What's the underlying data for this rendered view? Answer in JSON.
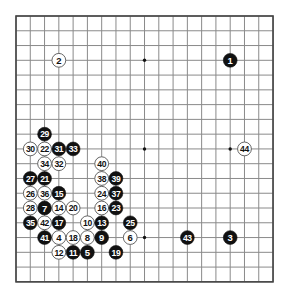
{
  "board": {
    "size": 19,
    "origin": {
      "x": 16,
      "y": 16
    },
    "step": {
      "x": 14.28,
      "y": 14.77
    },
    "colors": {
      "background": "#ffffff",
      "grid_line": "#8a8a8a",
      "border": "#444444",
      "star_point": "#111111",
      "black_stone": "#111111",
      "black_stone_text": "#ffffff",
      "white_stone": "#ffffff",
      "white_stone_border": "#555555",
      "white_stone_text": "#111111"
    },
    "star_points": [
      [
        4,
        4
      ],
      [
        10,
        4
      ],
      [
        16,
        4
      ],
      [
        4,
        10
      ],
      [
        10,
        10
      ],
      [
        16,
        10
      ],
      [
        4,
        16
      ],
      [
        10,
        16
      ],
      [
        16,
        16
      ]
    ]
  },
  "moves": [
    {
      "n": 1,
      "color": "black",
      "col": 16,
      "row": 4
    },
    {
      "n": 2,
      "color": "white",
      "col": 4,
      "row": 4
    },
    {
      "n": 3,
      "color": "black",
      "col": 16,
      "row": 16
    },
    {
      "n": 4,
      "color": "white",
      "col": 4,
      "row": 16
    },
    {
      "n": 5,
      "color": "black",
      "col": 6,
      "row": 17
    },
    {
      "n": 6,
      "color": "white",
      "col": 9,
      "row": 16
    },
    {
      "n": 7,
      "color": "black",
      "col": 3,
      "row": 14
    },
    {
      "n": 8,
      "color": "white",
      "col": 6,
      "row": 16
    },
    {
      "n": 9,
      "color": "black",
      "col": 7,
      "row": 16
    },
    {
      "n": 10,
      "color": "white",
      "col": 6,
      "row": 15
    },
    {
      "n": 11,
      "color": "black",
      "col": 5,
      "row": 17
    },
    {
      "n": 12,
      "color": "white",
      "col": 4,
      "row": 17
    },
    {
      "n": 13,
      "color": "black",
      "col": 7,
      "row": 15
    },
    {
      "n": 14,
      "color": "white",
      "col": 4,
      "row": 14
    },
    {
      "n": 15,
      "color": "black",
      "col": 4,
      "row": 13
    },
    {
      "n": 16,
      "color": "white",
      "col": 7,
      "row": 14
    },
    {
      "n": 17,
      "color": "black",
      "col": 4,
      "row": 15
    },
    {
      "n": 18,
      "color": "white",
      "col": 5,
      "row": 16
    },
    {
      "n": 19,
      "color": "black",
      "col": 8,
      "row": 17
    },
    {
      "n": 20,
      "color": "white",
      "col": 5,
      "row": 14
    },
    {
      "n": 21,
      "color": "black",
      "col": 3,
      "row": 12
    },
    {
      "n": 22,
      "color": "white",
      "col": 3,
      "row": 10
    },
    {
      "n": 23,
      "color": "black",
      "col": 8,
      "row": 14
    },
    {
      "n": 24,
      "color": "white",
      "col": 7,
      "row": 13
    },
    {
      "n": 25,
      "color": "black",
      "col": 9,
      "row": 15
    },
    {
      "n": 26,
      "color": "white",
      "col": 2,
      "row": 13
    },
    {
      "n": 27,
      "color": "black",
      "col": 2,
      "row": 12
    },
    {
      "n": 28,
      "color": "white",
      "col": 2,
      "row": 14
    },
    {
      "n": 29,
      "color": "black",
      "col": 3,
      "row": 9
    },
    {
      "n": 30,
      "color": "white",
      "col": 2,
      "row": 10
    },
    {
      "n": 31,
      "color": "black",
      "col": 4,
      "row": 10
    },
    {
      "n": 32,
      "color": "white",
      "col": 4,
      "row": 11
    },
    {
      "n": 33,
      "color": "black",
      "col": 5,
      "row": 10
    },
    {
      "n": 34,
      "color": "white",
      "col": 3,
      "row": 11
    },
    {
      "n": 35,
      "color": "black",
      "col": 2,
      "row": 15
    },
    {
      "n": 36,
      "color": "white",
      "col": 3,
      "row": 13
    },
    {
      "n": 37,
      "color": "black",
      "col": 8,
      "row": 13
    },
    {
      "n": 38,
      "color": "white",
      "col": 7,
      "row": 12
    },
    {
      "n": 39,
      "color": "black",
      "col": 8,
      "row": 12
    },
    {
      "n": 40,
      "color": "white",
      "col": 7,
      "row": 11
    },
    {
      "n": 41,
      "color": "black",
      "col": 3,
      "row": 16
    },
    {
      "n": 42,
      "color": "white",
      "col": 3,
      "row": 15
    },
    {
      "n": 43,
      "color": "black",
      "col": 13,
      "row": 16
    },
    {
      "n": 44,
      "color": "white",
      "col": 17,
      "row": 10
    }
  ]
}
